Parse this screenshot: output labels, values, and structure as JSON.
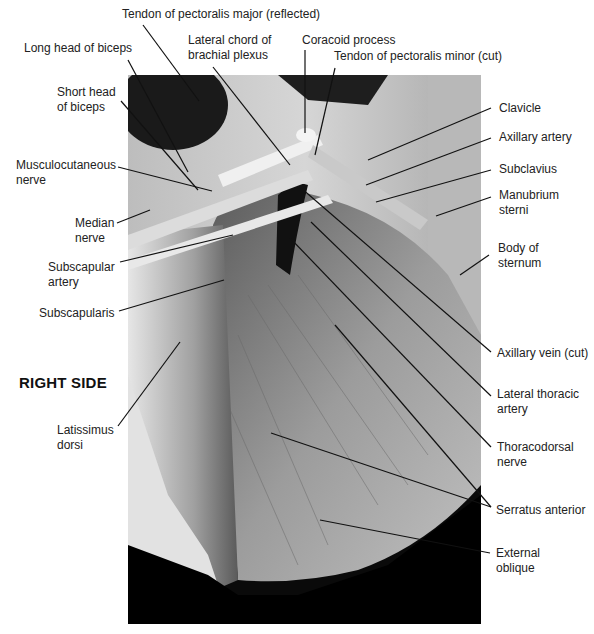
{
  "figure": {
    "side_label": "RIGHT SIDE",
    "labels": {
      "tendon_pect_major": "Tendon of pectoralis major (reflected)",
      "long_head_biceps": "Long head of biceps",
      "lateral_chord_1": "Lateral chord of",
      "lateral_chord_2": "brachial plexus",
      "coracoid": "Coracoid process",
      "tendon_pect_minor": "Tendon of pectoralis minor (cut)",
      "short_head_1": "Short head",
      "short_head_2": "of biceps",
      "clavicle": "Clavicle",
      "axillary_artery": "Axillary artery",
      "musculocutaneous_1": "Musculocutaneous",
      "musculocutaneous_2": "nerve",
      "subclavius": "Subclavius",
      "manubrium_1": "Manubrium",
      "manubrium_2": "sterni",
      "median_1": "Median",
      "median_2": "nerve",
      "body_sternum_1": "Body of",
      "body_sternum_2": "sternum",
      "subscapular_1": "Subscapular",
      "subscapular_2": "artery",
      "subscapularis": "Subscapularis",
      "axillary_vein": "Axillary vein (cut)",
      "lat_thoracic_1": "Lateral thoracic",
      "lat_thoracic_2": "artery",
      "latissimus_1": "Latissimus",
      "latissimus_2": "dorsi",
      "thoracodorsal_1": "Thoracodorsal",
      "thoracodorsal_2": "nerve",
      "serratus": "Serratus anterior",
      "external_1": "External",
      "external_2": "oblique"
    }
  }
}
